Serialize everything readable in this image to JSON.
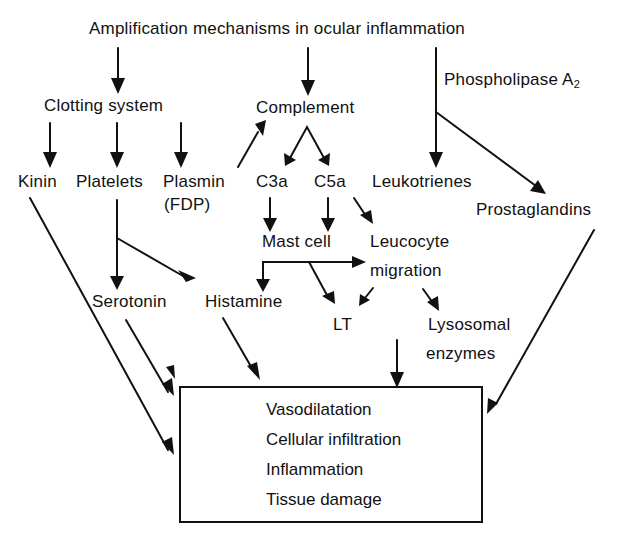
{
  "diagram": {
    "title": "Amplification mechanisms in ocular inflammation",
    "nodes": {
      "clotting_system": "Clotting system",
      "complement": "Complement",
      "phospholipase": "Phospholipase A",
      "phospholipase_sub": "2",
      "kinin": "Kinin",
      "platelets": "Platelets",
      "plasmin": "Plasmin",
      "plasmin_sub": "(FDP)",
      "c3a": "C3a",
      "c5a": "C5a",
      "leukotrienes": "Leukotrienes",
      "prostaglandins": "Prostaglandins",
      "mast_cell": "Mast cell",
      "leucocyte_line1": "Leucocyte",
      "leucocyte_line2": "migration",
      "serotonin": "Serotonin",
      "histamine": "Histamine",
      "lt": "LT",
      "lysosomal_line1": "Lysosomal",
      "lysosomal_line2": "enzymes"
    },
    "outcomes": [
      "Vasodilatation",
      "Cellular infiltration",
      "Inflammation",
      "Tissue damage"
    ],
    "edges": [
      {
        "from": "title",
        "to": "Clotting system"
      },
      {
        "from": "title",
        "to": "Complement"
      },
      {
        "from": "title",
        "to": "Leukotrienes",
        "label": "Phospholipase A2"
      },
      {
        "from": "Phospholipase A2",
        "to": "Prostaglandins"
      },
      {
        "from": "Clotting system",
        "to": "Kinin"
      },
      {
        "from": "Clotting system",
        "to": "Platelets"
      },
      {
        "from": "Clotting system",
        "to": "Plasmin (FDP)"
      },
      {
        "from": "Plasmin (FDP)",
        "to": "Complement"
      },
      {
        "from": "Complement",
        "to": "C3a"
      },
      {
        "from": "Complement",
        "to": "C5a"
      },
      {
        "from": "C3a",
        "to": "Mast cell"
      },
      {
        "from": "C5a",
        "to": "Mast cell"
      },
      {
        "from": "C5a",
        "to": "Leucocyte migration"
      },
      {
        "from": "Mast cell",
        "to": "Histamine"
      },
      {
        "from": "Mast cell",
        "to": "Leucocyte migration"
      },
      {
        "from": "Mast cell",
        "to": "LT"
      },
      {
        "from": "Leucocyte migration",
        "to": "LT"
      },
      {
        "from": "Leucocyte migration",
        "to": "Lysosomal enzymes"
      },
      {
        "from": "Platelets",
        "to": "Serotonin"
      },
      {
        "from": "Platelets",
        "to": "Histamine"
      },
      {
        "from": "Kinin",
        "to": "Outcomes"
      },
      {
        "from": "Serotonin",
        "to": "Outcomes"
      },
      {
        "from": "Histamine",
        "to": "Outcomes"
      },
      {
        "from": "Lysosomal enzymes",
        "to": "Outcomes"
      },
      {
        "from": "Prostaglandins",
        "to": "Outcomes"
      }
    ]
  }
}
